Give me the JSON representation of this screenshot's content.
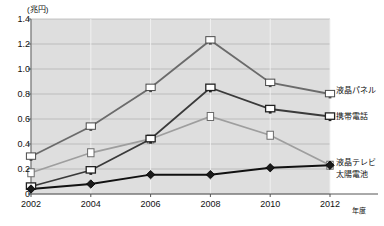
{
  "chart_data": {
    "type": "line",
    "title": "",
    "subtitle": "",
    "xlabel": "年度",
    "ylabel": "(兆円)",
    "x": [
      2002,
      2004,
      2006,
      2008,
      2010,
      2012
    ],
    "categories": [
      "2002",
      "2004",
      "2006",
      "2008",
      "2010",
      "2012"
    ],
    "ylim": [
      0,
      1.4
    ],
    "ytick_values": [
      0,
      0.2,
      0.4,
      0.6,
      0.8,
      1.0,
      1.2,
      1.4
    ],
    "ytick_labels": [
      "0",
      "0.2",
      "0.4",
      "0.6",
      "0.8",
      "1.0",
      "1.2",
      "1.4"
    ],
    "grid": true,
    "legend_position": "right",
    "plot_background": "#dedede",
    "series": [
      {
        "name": "液晶パネル",
        "color": "#6b6b6b",
        "marker": "monitor-open",
        "values": [
          0.3,
          0.54,
          0.85,
          1.23,
          0.89,
          0.8
        ]
      },
      {
        "name": "液晶テレビ",
        "color": "#9e9e9e",
        "marker": "square-open",
        "values": [
          0.17,
          0.33,
          0.44,
          0.62,
          0.47,
          0.23
        ]
      },
      {
        "name": "携帯電話",
        "color": "#3a3a3a",
        "marker": "monitor-filled",
        "values": [
          0.06,
          0.19,
          0.44,
          0.85,
          0.68,
          0.62
        ]
      },
      {
        "name": "太陽電池",
        "color": "#111111",
        "marker": "diamond-filled",
        "values": [
          0.04,
          0.08,
          0.155,
          0.155,
          0.21,
          0.23
        ]
      }
    ]
  },
  "axis": {
    "unit_label": "(兆円)",
    "x_unit_label": "年度"
  },
  "legend": {
    "items": [
      {
        "label": "液晶パネル"
      },
      {
        "label": "液晶テレビ"
      },
      {
        "label": "携帯電話"
      },
      {
        "label": "太陽電池"
      }
    ]
  }
}
